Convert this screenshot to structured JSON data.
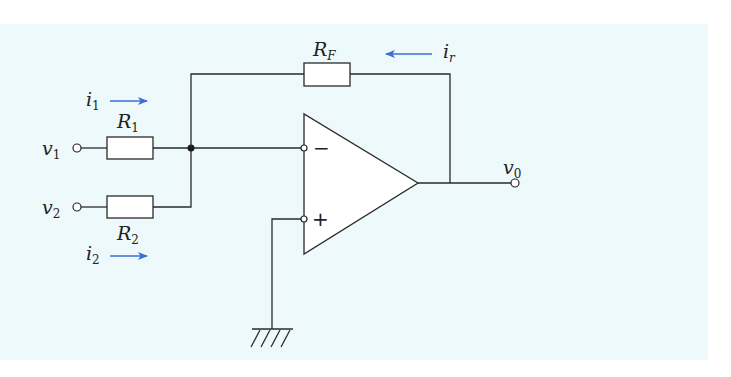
{
  "diagram": {
    "background_color": "#eef9fc",
    "arrow_color": "#3b6fd4",
    "inputs": [
      {
        "voltage": "v",
        "voltage_sub": "1",
        "resistor": "R",
        "resistor_sub": "1",
        "current": "i",
        "current_sub": "1"
      },
      {
        "voltage": "v",
        "voltage_sub": "2",
        "resistor": "R",
        "resistor_sub": "2",
        "current": "i",
        "current_sub": "2"
      }
    ],
    "feedback": {
      "resistor": "R",
      "resistor_sub": "F",
      "current": "i",
      "current_sub": "r"
    },
    "opamp": {
      "inverting_sign": "−",
      "noninverting_sign": "+"
    },
    "output": {
      "voltage": "v",
      "voltage_sub": "0"
    },
    "ground": {
      "symbol": "ground"
    }
  }
}
